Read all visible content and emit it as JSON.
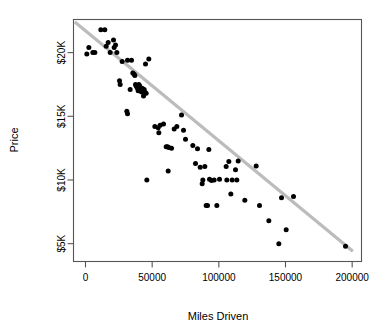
{
  "chart_data": {
    "type": "scatter",
    "title": "",
    "xlabel": "Miles Driven",
    "ylabel": "Price",
    "xlim": [
      -9000,
      207000
    ],
    "ylim": [
      3600,
      22600
    ],
    "grid": false,
    "legend": null,
    "x_ticks": [
      0,
      50000,
      100000,
      150000,
      200000
    ],
    "x_tick_labels": [
      "0",
      "50000",
      "100000",
      "150000",
      "200000"
    ],
    "y_ticks": [
      5000,
      10000,
      15000,
      20000
    ],
    "y_tick_labels": [
      "$5K",
      "$10K",
      "$15K",
      "$20K"
    ],
    "series": [
      {
        "name": "Used cars",
        "marker": "filled-circle",
        "color": "#000000",
        "points": [
          [
            1000,
            19900
          ],
          [
            2500,
            20400
          ],
          [
            5500,
            20000
          ],
          [
            7000,
            20000
          ],
          [
            11500,
            21800
          ],
          [
            14500,
            21800
          ],
          [
            15500,
            20500
          ],
          [
            17000,
            20800
          ],
          [
            18500,
            20000
          ],
          [
            21000,
            21000
          ],
          [
            21500,
            20400
          ],
          [
            22500,
            20600
          ],
          [
            23500,
            20000
          ],
          [
            25500,
            17800
          ],
          [
            26000,
            17500
          ],
          [
            27500,
            19300
          ],
          [
            31500,
            19400
          ],
          [
            31000,
            15400
          ],
          [
            31500,
            15200
          ],
          [
            33500,
            17100
          ],
          [
            34500,
            19400
          ],
          [
            35500,
            18400
          ],
          [
            36500,
            18300
          ],
          [
            37000,
            18200
          ],
          [
            37500,
            17500
          ],
          [
            38000,
            17400
          ],
          [
            38500,
            17300
          ],
          [
            39000,
            17200
          ],
          [
            39500,
            17000
          ],
          [
            40000,
            17500
          ],
          [
            40500,
            17400
          ],
          [
            41000,
            17250
          ],
          [
            41500,
            17100
          ],
          [
            42000,
            16900
          ],
          [
            42500,
            17200
          ],
          [
            43000,
            17000
          ],
          [
            43500,
            16600
          ],
          [
            44000,
            17100
          ],
          [
            44500,
            16900
          ],
          [
            45000,
            19100
          ],
          [
            45500,
            16800
          ],
          [
            46000,
            10000
          ],
          [
            47500,
            19500
          ],
          [
            52000,
            14200
          ],
          [
            54500,
            14100
          ],
          [
            55000,
            13700
          ],
          [
            56000,
            14300
          ],
          [
            58500,
            14400
          ],
          [
            60500,
            12600
          ],
          [
            61500,
            12600
          ],
          [
            62500,
            12550
          ],
          [
            62000,
            10700
          ],
          [
            64500,
            12500
          ],
          [
            66500,
            14000
          ],
          [
            68500,
            14200
          ],
          [
            72000,
            15100
          ],
          [
            73500,
            13900
          ],
          [
            75000,
            13200
          ],
          [
            80500,
            12700
          ],
          [
            82500,
            11300
          ],
          [
            84000,
            12450
          ],
          [
            86000,
            11000
          ],
          [
            87500,
            9700
          ],
          [
            88000,
            10000
          ],
          [
            89500,
            11050
          ],
          [
            90500,
            8000
          ],
          [
            91500,
            8000
          ],
          [
            92500,
            12400
          ],
          [
            93000,
            10050
          ],
          [
            94500,
            9950
          ],
          [
            96500,
            10000
          ],
          [
            98500,
            8000
          ],
          [
            100500,
            10050
          ],
          [
            105500,
            11050
          ],
          [
            106000,
            10000
          ],
          [
            107500,
            11450
          ],
          [
            109000,
            8900
          ],
          [
            110000,
            10000
          ],
          [
            112500,
            10800
          ],
          [
            113500,
            10000
          ],
          [
            114500,
            11500
          ],
          [
            119500,
            8400
          ],
          [
            128000,
            11100
          ],
          [
            130500,
            8000
          ],
          [
            137500,
            6800
          ],
          [
            145000,
            5000
          ],
          [
            147000,
            8600
          ],
          [
            150500,
            6100
          ],
          [
            156000,
            8700
          ],
          [
            195000,
            4800
          ]
        ]
      }
    ],
    "trend_line": {
      "name": "linear-fit",
      "color": "#bcbcbc",
      "x_start": -8000,
      "y_start": 22400,
      "x_end": 200500,
      "y_end": 4400
    }
  },
  "axes": {
    "y_axis_title": "Price",
    "x_axis_title": "Miles Driven"
  }
}
